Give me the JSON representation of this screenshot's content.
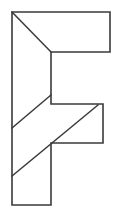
{
  "figure": {
    "kind": "line-drawing",
    "stroke_color": "#3a3a3a",
    "fill_color": "#ffffff",
    "background_color": "#ffffff",
    "canvas": {
      "width": 116,
      "height": 216
    },
    "outline": {
      "name": "letter-f-outline",
      "points": "12,12 110,12 110,52 51,52 51,104 103,104 103,143 51,143 51,205 12,205",
      "closed": true
    },
    "cuts": [
      {
        "name": "diagonal-top-arm",
        "from": [
          12,
          12
        ],
        "to": [
          51,
          52
        ],
        "points": "12,12 51,52"
      },
      {
        "name": "diagonal-upper-stem",
        "from": [
          12,
          128
        ],
        "to": [
          51,
          95
        ],
        "points": "12,128 51,95"
      },
      {
        "name": "diagonal-lower-stem-through-middle-bar",
        "from": [
          12,
          176
        ],
        "to": [
          98,
          105
        ],
        "points": "12,176 98,105"
      }
    ]
  }
}
